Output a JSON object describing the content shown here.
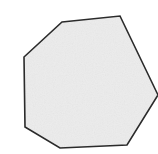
{
  "canvas": {
    "width": 158,
    "height": 154,
    "background_color": "#ffffff",
    "label": "shape-canvas"
  },
  "shape": {
    "name": "heptagon",
    "kind": "polygon",
    "sides": 7,
    "fill_color": "#ececec",
    "fill_texture": "speckled-noise",
    "texture_color": "#e0e0e0",
    "stroke_color": "#2b2b2b",
    "stroke_width": 1.6,
    "clipped_edge": "right",
    "points": "62,22 120,16 158,95 127,145 60,148 25,127 24,57",
    "vertices": [
      {
        "name": "top-left",
        "x": 62,
        "y": 22
      },
      {
        "name": "top-right",
        "x": 120,
        "y": 16
      },
      {
        "name": "right",
        "x": 158,
        "y": 95
      },
      {
        "name": "bottom-right",
        "x": 127,
        "y": 145
      },
      {
        "name": "bottom-left",
        "x": 60,
        "y": 148
      },
      {
        "name": "lower-left",
        "x": 25,
        "y": 127
      },
      {
        "name": "upper-left",
        "x": 24,
        "y": 57
      }
    ]
  }
}
